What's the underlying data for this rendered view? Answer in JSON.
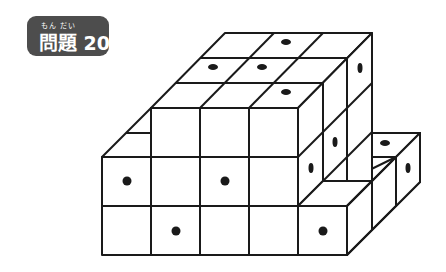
{
  "badge": {
    "ruby": "もん だい",
    "title": "問題 20",
    "color": "#4d4d4d"
  },
  "figure": {
    "cube_size": 49,
    "line_color": "#1a1a1a",
    "dot_color": "#1a1a1a"
  }
}
